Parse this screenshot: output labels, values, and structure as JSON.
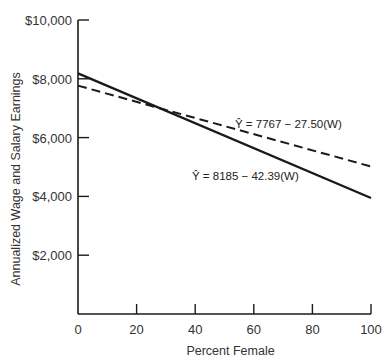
{
  "chart_data": {
    "type": "line",
    "title": "",
    "xlabel": "Percent Female",
    "ylabel": "Annualized Wage and Salary Earnings",
    "xlim": [
      0,
      100
    ],
    "ylim": [
      0,
      10000
    ],
    "x_ticks": [
      0,
      20,
      40,
      60,
      80,
      100
    ],
    "x_tick_labels": [
      "0",
      "20",
      "40",
      "60",
      "80",
      "100"
    ],
    "y_ticks": [
      2000,
      4000,
      6000,
      8000,
      10000
    ],
    "y_tick_labels": [
      "$2,000",
      "$4,000",
      "$6,000",
      "$8,000",
      "$10,000"
    ],
    "grid": false,
    "legend": "none",
    "series": [
      {
        "name": "dashed",
        "style": "dashed",
        "intercept": 7767,
        "slope": -27.5,
        "x": [
          0,
          100
        ],
        "values": [
          7767,
          5017
        ],
        "annotation": "Ŷ = 7767 − 27.50(W)",
        "color": "#1a1a1a"
      },
      {
        "name": "solid",
        "style": "solid",
        "intercept": 8185,
        "slope": -42.39,
        "x": [
          0,
          100
        ],
        "values": [
          8185,
          3946
        ],
        "annotation": "Ŷ = 8185 − 42.39(W)",
        "color": "#1a1a1a"
      }
    ]
  }
}
